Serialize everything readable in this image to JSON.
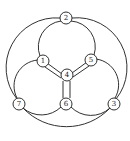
{
  "diagram": {
    "type": "graph",
    "nodes": [
      {
        "id": "1",
        "label": "1",
        "x": 43,
        "y": 61
      },
      {
        "id": "2",
        "label": "2",
        "x": 66,
        "y": 18
      },
      {
        "id": "3",
        "label": "3",
        "x": 114,
        "y": 104
      },
      {
        "id": "4",
        "label": "4",
        "x": 67,
        "y": 75
      },
      {
        "id": "5",
        "label": "5",
        "x": 91,
        "y": 60
      },
      {
        "id": "6",
        "label": "6",
        "x": 66,
        "y": 104
      },
      {
        "id": "7",
        "label": "7",
        "x": 19,
        "y": 104
      }
    ],
    "edges": [
      {
        "from": "2",
        "to": "1",
        "style": "arc"
      },
      {
        "from": "2",
        "to": "5",
        "style": "arc"
      },
      {
        "from": "2",
        "to": "7",
        "style": "outer-arc"
      },
      {
        "from": "2",
        "to": "3",
        "style": "outer-arc"
      },
      {
        "from": "7",
        "to": "3",
        "style": "outer-arc"
      },
      {
        "from": "1",
        "to": "7",
        "style": "arc"
      },
      {
        "from": "5",
        "to": "3",
        "style": "arc"
      },
      {
        "from": "7",
        "to": "6",
        "style": "arc"
      },
      {
        "from": "6",
        "to": "3",
        "style": "arc"
      },
      {
        "from": "1",
        "to": "4",
        "style": "double"
      },
      {
        "from": "5",
        "to": "4",
        "style": "double"
      },
      {
        "from": "6",
        "to": "4",
        "style": "double"
      }
    ]
  }
}
